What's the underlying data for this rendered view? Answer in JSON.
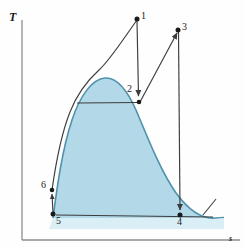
{
  "figure": {
    "kind": "temperature-entropy-diagram",
    "background": "#fefefe",
    "axes": {
      "y_label": "T",
      "x_label": "s",
      "axis_color": "#8c8c8c",
      "y_axis_x": 22,
      "y_axis_top": 20,
      "y_axis_bottom": 240,
      "x_axis_y": 240,
      "x_axis_left": 22,
      "x_axis_right": 240
    },
    "colors": {
      "dome_fill": "#b3d9e8",
      "dome_edge": "#4e92ac",
      "process_line": "#3c3c3c",
      "state_point": "#1a1a1a",
      "lower_band": "#d8ecf4"
    },
    "state_points": [
      {
        "id": "1",
        "label": "1",
        "x": 137,
        "y": 19,
        "label_x": 141,
        "label_y": 13
      },
      {
        "id": "2",
        "label": "2",
        "x": 139,
        "y": 102,
        "label_x": 128,
        "label_y": 86
      },
      {
        "id": "3",
        "label": "3",
        "x": 178,
        "y": 30,
        "label_x": 182,
        "label_y": 24
      },
      {
        "id": "4",
        "label": "4",
        "x": 180,
        "y": 215,
        "label_x": 177,
        "label_y": 219
      },
      {
        "id": "5",
        "label": "5",
        "x": 53,
        "y": 214,
        "label_x": 55,
        "label_y": 219
      },
      {
        "id": "6",
        "label": "6",
        "x": 52,
        "y": 190,
        "label_x": 42,
        "label_y": 181
      }
    ],
    "processes": [
      {
        "name": "6-1-pump-boiler",
        "from": "6",
        "to": "1",
        "type": "curve"
      },
      {
        "name": "1-2-expansion",
        "from": "1",
        "to": "2",
        "type": "arrow-down"
      },
      {
        "name": "2-3-reheat",
        "from": "2",
        "to": "3",
        "type": "arrow-up"
      },
      {
        "name": "3-4-expansion",
        "from": "3",
        "to": "4",
        "type": "arrow-down"
      },
      {
        "name": "4-5-condenser",
        "from": "4",
        "to": "5",
        "type": "arrow-left"
      },
      {
        "name": "5-6-pump",
        "from": "5",
        "to": "6",
        "type": "arrow-up"
      },
      {
        "name": "2-isobar",
        "from": "dome-left",
        "to": "2",
        "type": "horizontal"
      }
    ],
    "dome": {
      "peak_x": 105,
      "peak_y": 78,
      "left_foot_x": 53,
      "right_foot_x": 215,
      "base_y": 218
    }
  }
}
